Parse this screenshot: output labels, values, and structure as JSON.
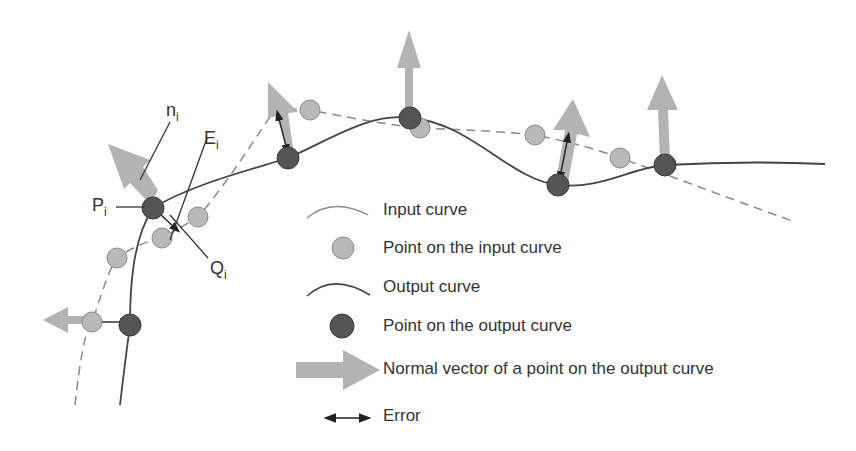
{
  "labels": {
    "n": {
      "main": "n",
      "sub": "i"
    },
    "E": {
      "main": "E",
      "sub": "i"
    },
    "P": {
      "main": "P",
      "sub": "i"
    },
    "Q": {
      "main": "Q",
      "sub": "i"
    }
  },
  "legend": [
    {
      "symbol": "input-curve-line",
      "label": "Input curve"
    },
    {
      "symbol": "input-point",
      "label": "Point on the input curve"
    },
    {
      "symbol": "output-curve-line",
      "label": "Output curve"
    },
    {
      "symbol": "output-point",
      "label": "Point on the output curve"
    },
    {
      "symbol": "normal-arrow",
      "label": "Normal vector of a point on the output curve"
    },
    {
      "symbol": "error-arrow",
      "label": "Error"
    }
  ],
  "colors": {
    "input_point": "#b9b9b9",
    "output_point": "#555555",
    "normal_arrow": "#b3b3b3",
    "curve": "#444444",
    "input_curve_dashed": "#8a8a8a"
  }
}
